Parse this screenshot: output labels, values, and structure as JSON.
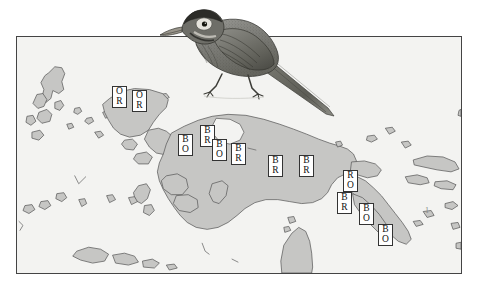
{
  "figure": {
    "type": "distribution-map",
    "region": "New Guinea and adjacent islands",
    "island_marker_number": "1"
  },
  "colors": {
    "land": "#c6c6c4",
    "sea": "#f3f3f1",
    "coastline": "#5a5a5a",
    "frame": "#444444",
    "label_box": "#ffffff",
    "label_text": "#111111"
  },
  "map": {
    "labels": [
      {
        "name": "label-or-1",
        "line1": "O",
        "line2": "R",
        "x": 112,
        "y": 86
      },
      {
        "name": "label-or-2",
        "line1": "O",
        "line2": "R",
        "x": 132,
        "y": 90
      },
      {
        "name": "label-bo-1",
        "line1": "B",
        "line2": "O",
        "x": 178,
        "y": 134
      },
      {
        "name": "label-br-1",
        "line1": "B",
        "line2": "R",
        "x": 200,
        "y": 125
      },
      {
        "name": "label-bo-2",
        "line1": "B",
        "line2": "O",
        "x": 212,
        "y": 139
      },
      {
        "name": "label-br-2",
        "line1": "B",
        "line2": "R",
        "x": 231,
        "y": 143
      },
      {
        "name": "label-br-3",
        "line1": "B",
        "line2": "R",
        "x": 268,
        "y": 155
      },
      {
        "name": "label-br-4",
        "line1": "B",
        "line2": "R",
        "x": 299,
        "y": 155
      },
      {
        "name": "label-ro-1",
        "line1": "R",
        "line2": "O",
        "x": 343,
        "y": 170
      },
      {
        "name": "label-br-5",
        "line1": "B",
        "line2": "R",
        "x": 337,
        "y": 192
      },
      {
        "name": "label-bo-3",
        "line1": "B",
        "line2": "O",
        "x": 359,
        "y": 203
      },
      {
        "name": "label-bo-4",
        "line1": "B",
        "line2": "O",
        "x": 378,
        "y": 224
      }
    ],
    "island_number": {
      "text": "1",
      "x": 424,
      "y": 205
    }
  },
  "bird": {
    "name": "perched-bird-engraving",
    "description": "engraved passerine bird with long decurved bill, dark crown, pale eye-ring, streaked breast and long tail"
  }
}
